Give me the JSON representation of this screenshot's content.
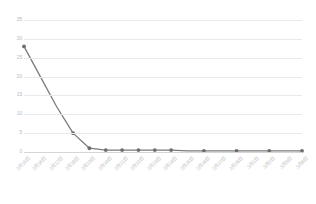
{
  "chart_data": {
    "type": "line",
    "title": "",
    "xlabel": "",
    "ylabel": "",
    "ylim": [
      0,
      35
    ],
    "yticks": [
      0,
      5,
      10,
      15,
      20,
      25,
      30,
      35
    ],
    "grid": true,
    "legend": false,
    "legend_position": "none",
    "line_color": "#7b7b7b",
    "marker_color": "#6e6e6e",
    "grid_color": "#e9e9e9",
    "tick_label_color": "#bdbdbd",
    "categories": [
      "2月15日",
      "2月16日",
      "2月17日",
      "2月18日",
      "2月19日",
      "2月20日",
      "2月21日",
      "2月22日",
      "2月23日",
      "2月24日",
      "2月25日",
      "2月26日",
      "2月27日",
      "2月28日",
      "3月1日",
      "3月2日",
      "3月3日",
      "3月8日"
    ],
    "values": [
      28,
      20,
      12,
      5,
      1,
      0.5,
      0.5,
      0.5,
      0.5,
      0.5,
      0.3,
      0.3,
      0.3,
      0.3,
      0.3,
      0.3,
      0.3,
      0.3
    ],
    "series": [
      {
        "name": "新增确诊",
        "values": [
          28,
          20,
          12,
          5,
          1,
          0.5,
          0.5,
          0.5,
          0.5,
          0.5,
          0.3,
          0.3,
          0.3,
          0.3,
          0.3,
          0.3,
          0.3,
          0.3
        ]
      }
    ],
    "markers_shown_at": [
      0,
      3,
      4,
      5,
      6,
      7,
      8,
      9,
      11,
      13,
      15,
      17
    ]
  }
}
